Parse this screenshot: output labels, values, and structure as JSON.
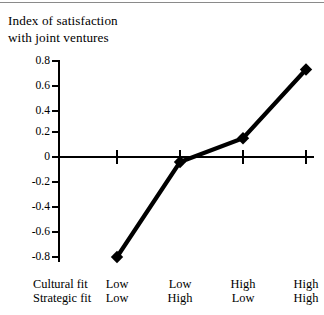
{
  "chart_data": {
    "type": "line",
    "title": "Index of satisfaction\nwith joint ventures",
    "xlabel": "",
    "ylabel": "",
    "ylim": [
      -0.8,
      0.8
    ],
    "ytick_labels": [
      "0.8",
      "0.6",
      "0.4",
      "0.2",
      "0",
      "-0.2",
      "-0.4",
      "-0.6",
      "-0.8"
    ],
    "ytick_values": [
      0.8,
      0.6,
      0.4,
      0.2,
      0,
      -0.2,
      -0.4,
      -0.6,
      -0.8
    ],
    "grid": false,
    "legend": "none",
    "marker": "diamond",
    "line_color": "#000000",
    "categories": [
      "Low / Low",
      "Low / High",
      "High / Low",
      "High / High"
    ],
    "values": [
      -0.8,
      -0.04,
      0.15,
      0.7
    ],
    "axis_row_headers": [
      "Cultural fit",
      "Strategic fit"
    ],
    "axis_groups": [
      {
        "cultural_fit": "Low",
        "strategic_fit": "Low"
      },
      {
        "cultural_fit": "Low",
        "strategic_fit": "High"
      },
      {
        "cultural_fit": "High",
        "strategic_fit": "Low"
      },
      {
        "cultural_fit": "High",
        "strategic_fit": "High"
      }
    ]
  }
}
